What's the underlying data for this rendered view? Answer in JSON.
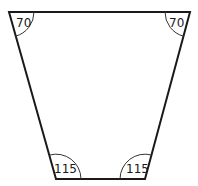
{
  "figure": {
    "shape": "trapezoid",
    "vertices": {
      "top_left": [
        9,
        12
      ],
      "top_right": [
        190,
        12
      ],
      "bottom_right": [
        145,
        179
      ],
      "bottom_left": [
        56,
        179
      ]
    },
    "angles": [
      {
        "corner": "top_left",
        "label": "70"
      },
      {
        "corner": "top_right",
        "label": "70"
      },
      {
        "corner": "bottom_left",
        "label": "115"
      },
      {
        "corner": "bottom_right",
        "label": "115"
      }
    ],
    "stroke_color": "#1a1a1a"
  }
}
